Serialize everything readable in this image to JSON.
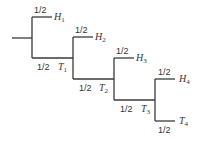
{
  "diagram": {
    "type": "probability-tree",
    "root": {
      "x1": 12,
      "x2": 32,
      "y": 38
    },
    "stages": [
      {
        "x": 32,
        "top_y": 17,
        "bottom_y": 58,
        "next_x": 73,
        "top_prob": "1/2",
        "top_label": "H",
        "top_sub": "1",
        "bottom_prob": "1/2",
        "bottom_label": "T",
        "bottom_sub": "1"
      },
      {
        "x": 73,
        "top_y": 37,
        "bottom_y": 79,
        "next_x": 114,
        "top_prob": "1/2",
        "top_label": "H",
        "top_sub": "2",
        "bottom_prob": "1/2",
        "bottom_label": "T",
        "bottom_sub": "2"
      },
      {
        "x": 114,
        "top_y": 58,
        "bottom_y": 100,
        "next_x": 155,
        "top_prob": "1/2",
        "top_label": "H",
        "top_sub": "3",
        "bottom_prob": "1/2",
        "bottom_label": "T",
        "bottom_sub": "3"
      },
      {
        "x": 155,
        "top_y": 79,
        "bottom_y": 121,
        "next_x": 175,
        "top_prob": "1/2",
        "top_label": "H",
        "top_sub": "4",
        "bottom_prob": "1/2",
        "bottom_label": "T",
        "bottom_sub": "4"
      }
    ]
  }
}
